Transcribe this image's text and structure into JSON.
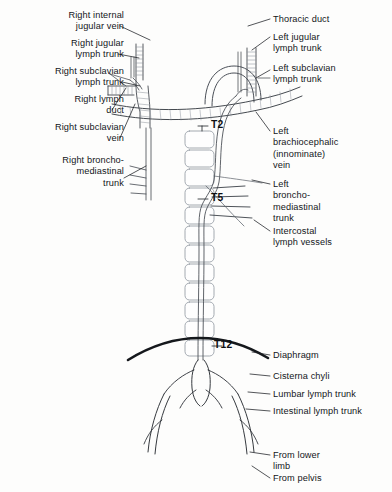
{
  "figure": {
    "background_color": "#fdfdfc",
    "ink_color": "#13161a"
  },
  "labels_left": [
    {
      "id": "right-internal-jugular-vein",
      "text": "Right internal\njugular vein",
      "x": 6,
      "y": 10,
      "w": 118
    },
    {
      "id": "right-jugular-lymph-trunk",
      "text": "Right jugular\nlymph trunk",
      "x": 6,
      "y": 38,
      "w": 118
    },
    {
      "id": "right-subclavian-lymph-trunk",
      "text": "Right subclavian\nlymph trunk",
      "x": 4,
      "y": 66,
      "w": 120
    },
    {
      "id": "right-lymph-duct",
      "text": "Right lymph\nduct",
      "x": 6,
      "y": 94,
      "w": 118
    },
    {
      "id": "right-subclavian-vein",
      "text": "Right subclavian\nvein",
      "x": 4,
      "y": 122,
      "w": 120
    },
    {
      "id": "right-broncho-mediastinal-trunk",
      "text": "Right broncho-\nmediastinal\ntrunk",
      "x": 6,
      "y": 155,
      "w": 118
    }
  ],
  "labels_right": [
    {
      "id": "thoracic-duct",
      "text": "Thoracic duct",
      "x": 273,
      "y": 14,
      "w": 116
    },
    {
      "id": "left-jugular-lymph-trunk",
      "text": "Left jugular\nlymph trunk",
      "x": 273,
      "y": 32,
      "w": 116
    },
    {
      "id": "left-subclavian-lymph-trunk",
      "text": "Left subclavian\nlymph trunk",
      "x": 273,
      "y": 63,
      "w": 116
    },
    {
      "id": "left-brachiocephalic-innominate-vein",
      "text": "Left\nbrachiocephalic\n(innominate)\nvein",
      "x": 273,
      "y": 126,
      "w": 116
    },
    {
      "id": "left-broncho-mediastinal-trunk",
      "text": "Left\nbroncho-\nmediastinal\ntrunk",
      "x": 273,
      "y": 179,
      "w": 116
    },
    {
      "id": "intercostal-lymph-vessels",
      "text": "Intercostal\nlymph vessels",
      "x": 273,
      "y": 226,
      "w": 116
    },
    {
      "id": "diaphragm",
      "text": "Diaphragm",
      "x": 273,
      "y": 350,
      "w": 116
    },
    {
      "id": "cisterna-chyli",
      "text": "Cisterna chyli",
      "x": 273,
      "y": 371,
      "w": 116
    },
    {
      "id": "lumbar-lymph-trunk",
      "text": "Lumbar lymph trunk",
      "x": 273,
      "y": 389,
      "w": 116
    },
    {
      "id": "intestinal-lymph-trunk",
      "text": "Intestinal lymph trunk",
      "x": 273,
      "y": 406,
      "w": 116
    },
    {
      "id": "from-lower-limb",
      "text": "From lower\nlimb",
      "x": 273,
      "y": 450,
      "w": 116
    },
    {
      "id": "from-pelvis",
      "text": "From pelvis",
      "x": 273,
      "y": 473,
      "w": 116
    }
  ],
  "vertebral_levels": [
    {
      "id": "vertebral-level-t2",
      "text": "T2",
      "x": 211,
      "y": 119
    },
    {
      "id": "vertebral-level-t5",
      "text": "T5",
      "x": 211,
      "y": 192
    },
    {
      "id": "vertebral-level-t12",
      "text": "T12",
      "x": 214,
      "y": 339
    }
  ]
}
